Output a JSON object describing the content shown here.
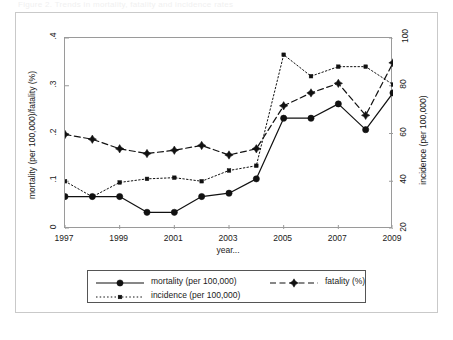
{
  "page_header_text": "Figure 2. Trends in mortality, fatality and incidence rates",
  "axes": {
    "left": {
      "title": "mortality (per 100,000)/fatality (%)",
      "ticks": [
        "0",
        ".1",
        ".2",
        ".3",
        ".4"
      ],
      "min": 0,
      "max": 0.4
    },
    "right": {
      "title": "incidence (per 100,000)",
      "ticks": [
        "20",
        "40",
        "60",
        "80",
        "100"
      ],
      "min": 20,
      "max": 100
    },
    "x": {
      "title": "year...",
      "ticks": [
        "1997",
        "1999",
        "2001",
        "2003",
        "2005",
        "2007",
        "2009"
      ],
      "min": 1997,
      "max": 2009
    }
  },
  "legend": {
    "items": [
      {
        "label": "mortality (per 100,000)",
        "style": "solid",
        "marker": "circle",
        "color": "#111111"
      },
      {
        "label": "fatality (%)",
        "style": "dashed",
        "marker": "diamond",
        "color": "#111111"
      },
      {
        "label": "incidence (per 100,000)",
        "style": "dotted",
        "marker": "square",
        "color": "#111111"
      }
    ]
  },
  "chart_data": {
    "type": "line",
    "title": "",
    "subtitle": "",
    "xlabel": "year...",
    "ylabel": "mortality (per 100,000)/fatality (%)",
    "y2label": "incidence (per 100,000)",
    "xlim": [
      1997,
      2009
    ],
    "ylim": [
      0,
      0.4
    ],
    "y2lim": [
      20,
      100
    ],
    "grid": false,
    "legend_position": "below-plot",
    "x": [
      1997,
      1998,
      1999,
      2000,
      2001,
      2002,
      2003,
      2004,
      2005,
      2006,
      2007,
      2008,
      2009
    ],
    "series": [
      {
        "name": "mortality (per 100,000)",
        "axis": "left",
        "style": "solid",
        "marker": "circle",
        "values": [
          0.068,
          0.068,
          0.068,
          0.035,
          0.035,
          0.068,
          0.075,
          0.105,
          0.232,
          0.232,
          0.262,
          0.208,
          0.285
        ]
      },
      {
        "name": "fatality (%)",
        "axis": "left",
        "style": "dashed",
        "marker": "diamond",
        "values": [
          0.198,
          0.188,
          0.168,
          0.158,
          0.165,
          0.175,
          0.155,
          0.168,
          0.258,
          0.285,
          0.305,
          0.238,
          0.348
        ]
      },
      {
        "name": "incidence (per 100,000)",
        "axis": "right",
        "style": "dotted",
        "marker": "square",
        "values": [
          40.0,
          33.5,
          39.5,
          41.0,
          41.5,
          40.0,
          44.5,
          46.5,
          93.0,
          84.0,
          88.0,
          88.0,
          80.5
        ]
      }
    ]
  }
}
